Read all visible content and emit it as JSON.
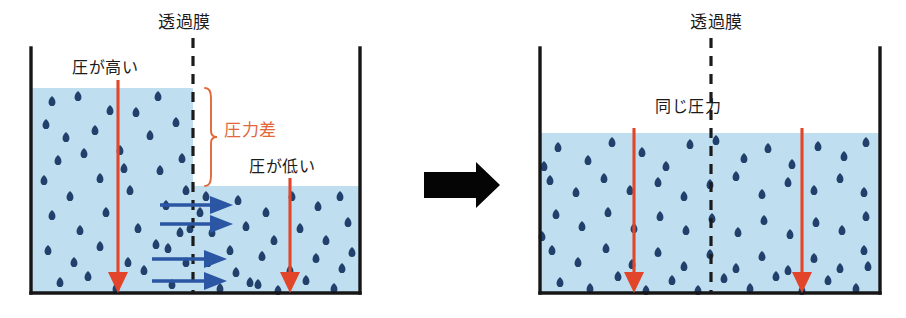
{
  "figure": {
    "type": "diagram",
    "colors": {
      "water_fill": "#bfdff0",
      "droplet": "#21406b",
      "membrane_line": "#1b1b1b",
      "container_wall": "#161616",
      "red_arrow": "#e2452a",
      "blue_arrow": "#2b56a4",
      "accent_text": "#e2683c",
      "body_text": "#1b1b1b",
      "transition_arrow": "#050505",
      "background": "#ffffff"
    }
  },
  "left_panel": {
    "name": "before-state",
    "membrane_label": "透過膜",
    "high_pressure_label": "圧が高い",
    "low_pressure_label": "圧が低い",
    "pressure_difference_label": "圧力差",
    "container": {
      "x": 30,
      "y": 48,
      "width": 330,
      "height": 247
    },
    "left_water_level_y": 88,
    "right_water_level_y": 186,
    "membrane_x": 193,
    "red_arrows": [
      {
        "name": "high-pressure-arrow",
        "x": 118,
        "y_start": 80,
        "y_end": 292
      },
      {
        "name": "low-pressure-arrow",
        "x": 290,
        "y_start": 178,
        "y_end": 292
      }
    ],
    "blue_arrows": [
      {
        "name": "flow-arrow-1",
        "y": 205,
        "x_start": 160,
        "x_end": 232
      },
      {
        "name": "flow-arrow-2",
        "y": 224,
        "x_start": 160,
        "x_end": 232
      },
      {
        "name": "flow-arrow-3",
        "y": 259,
        "x_start": 152,
        "x_end": 226
      },
      {
        "name": "flow-arrow-4",
        "y": 281,
        "x_start": 152,
        "x_end": 226
      }
    ],
    "bracket": {
      "x": 210,
      "y_top": 88,
      "y_bottom": 186
    },
    "droplets_left": [
      [
        52,
        101
      ],
      [
        78,
        96
      ],
      [
        110,
        110
      ],
      [
        46,
        124
      ],
      [
        66,
        137
      ],
      [
        95,
        130
      ],
      [
        136,
        112
      ],
      [
        158,
        96
      ],
      [
        58,
        160
      ],
      [
        84,
        153
      ],
      [
        120,
        150
      ],
      [
        150,
        135
      ],
      [
        176,
        122
      ],
      [
        44,
        180
      ],
      [
        70,
        196
      ],
      [
        100,
        178
      ],
      [
        130,
        190
      ],
      [
        160,
        170
      ],
      [
        182,
        158
      ],
      [
        52,
        215
      ],
      [
        80,
        230
      ],
      [
        106,
        212
      ],
      [
        138,
        228
      ],
      [
        166,
        205
      ],
      [
        186,
        190
      ],
      [
        48,
        250
      ],
      [
        74,
        262
      ],
      [
        100,
        246
      ],
      [
        128,
        262
      ],
      [
        156,
        244
      ],
      [
        180,
        232
      ],
      [
        60,
        282
      ],
      [
        88,
        276
      ],
      [
        116,
        288
      ],
      [
        144,
        270
      ],
      [
        172,
        284
      ],
      [
        186,
        262
      ],
      [
        168,
        248
      ],
      [
        190,
        228
      ],
      [
        124,
        168
      ]
    ],
    "droplets_right": [
      [
        206,
        196
      ],
      [
        238,
        200
      ],
      [
        266,
        212
      ],
      [
        292,
        196
      ],
      [
        318,
        206
      ],
      [
        340,
        196
      ],
      [
        212,
        232
      ],
      [
        246,
        226
      ],
      [
        274,
        240
      ],
      [
        300,
        228
      ],
      [
        326,
        240
      ],
      [
        348,
        222
      ],
      [
        208,
        262
      ],
      [
        236,
        272
      ],
      [
        262,
        256
      ],
      [
        290,
        270
      ],
      [
        316,
        258
      ],
      [
        342,
        268
      ],
      [
        220,
        288
      ],
      [
        250,
        282
      ],
      [
        278,
        290
      ],
      [
        306,
        280
      ],
      [
        334,
        288
      ],
      [
        352,
        252
      ],
      [
        200,
        212
      ],
      [
        230,
        250
      ],
      [
        258,
        284
      ]
    ],
    "droplets_above_membrane_right": [
      [
        196,
        92
      ],
      [
        188,
        140
      ]
    ]
  },
  "transition": {
    "name": "transition-arrow",
    "label": "",
    "x": 424,
    "y": 168,
    "width": 78,
    "height": 34
  },
  "right_panel": {
    "name": "after-state",
    "membrane_label": "透過膜",
    "equal_pressure_label": "同じ圧力",
    "container": {
      "x": 39,
      "y": 48,
      "width": 341,
      "height": 247
    },
    "water_level_y": 133,
    "membrane_x": 211,
    "red_arrows": [
      {
        "name": "equal-pressure-arrow-left",
        "x": 134,
        "y_start": 128,
        "y_end": 292
      },
      {
        "name": "equal-pressure-arrow-right",
        "x": 302,
        "y_start": 128,
        "y_end": 292
      }
    ],
    "droplets": [
      [
        58,
        147
      ],
      [
        88,
        160
      ],
      [
        112,
        142
      ],
      [
        142,
        152
      ],
      [
        166,
        166
      ],
      [
        190,
        144
      ],
      [
        216,
        140
      ],
      [
        244,
        158
      ],
      [
        268,
        148
      ],
      [
        292,
        164
      ],
      [
        318,
        146
      ],
      [
        344,
        156
      ],
      [
        366,
        142
      ],
      [
        50,
        180
      ],
      [
        76,
        192
      ],
      [
        104,
        178
      ],
      [
        130,
        190
      ],
      [
        158,
        182
      ],
      [
        184,
        196
      ],
      [
        210,
        184
      ],
      [
        236,
        176
      ],
      [
        262,
        194
      ],
      [
        288,
        182
      ],
      [
        314,
        190
      ],
      [
        340,
        178
      ],
      [
        364,
        192
      ],
      [
        56,
        214
      ],
      [
        82,
        226
      ],
      [
        108,
        212
      ],
      [
        134,
        228
      ],
      [
        160,
        216
      ],
      [
        186,
        230
      ],
      [
        212,
        218
      ],
      [
        238,
        232
      ],
      [
        264,
        220
      ],
      [
        290,
        234
      ],
      [
        316,
        222
      ],
      [
        342,
        230
      ],
      [
        366,
        216
      ],
      [
        52,
        250
      ],
      [
        78,
        262
      ],
      [
        106,
        248
      ],
      [
        132,
        264
      ],
      [
        158,
        252
      ],
      [
        184,
        266
      ],
      [
        210,
        254
      ],
      [
        236,
        268
      ],
      [
        262,
        256
      ],
      [
        288,
        270
      ],
      [
        314,
        258
      ],
      [
        340,
        268
      ],
      [
        364,
        250
      ],
      [
        60,
        282
      ],
      [
        90,
        288
      ],
      [
        118,
        276
      ],
      [
        146,
        290
      ],
      [
        172,
        280
      ],
      [
        198,
        290
      ],
      [
        224,
        278
      ],
      [
        250,
        288
      ],
      [
        276,
        276
      ],
      [
        302,
        290
      ],
      [
        328,
        280
      ],
      [
        356,
        288
      ],
      [
        368,
        266
      ],
      [
        44,
        166
      ],
      [
        42,
        236
      ]
    ]
  }
}
